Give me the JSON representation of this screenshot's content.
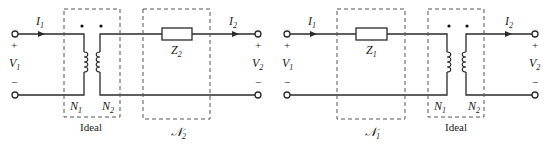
{
  "diagram": {
    "circuits": [
      {
        "id": "left",
        "input_current": {
          "name": "I",
          "sub": "1"
        },
        "input_voltage": {
          "name": "V",
          "sub": "1"
        },
        "output_current": {
          "name": "I",
          "sub": "2"
        },
        "output_voltage": {
          "name": "V",
          "sub": "2"
        },
        "plus": "+",
        "minus": "−",
        "transformer": {
          "box_label": "Ideal",
          "primary": {
            "name": "N",
            "sub": "1"
          },
          "secondary": {
            "name": "N",
            "sub": "2"
          }
        },
        "network": {
          "box_label": {
            "name": "𝒩",
            "sub": "2"
          },
          "impedance": {
            "name": "Z",
            "sub": "2"
          }
        }
      },
      {
        "id": "right",
        "input_current": {
          "name": "I",
          "sub": "1"
        },
        "input_voltage": {
          "name": "V",
          "sub": "1"
        },
        "output_current": {
          "name": "I",
          "sub": "2"
        },
        "output_voltage": {
          "name": "V",
          "sub": "2"
        },
        "plus": "+",
        "minus": "−",
        "network": {
          "box_label": {
            "name": "𝒩",
            "sub": "1"
          },
          "impedance": {
            "name": "Z",
            "sub": "1"
          }
        },
        "transformer": {
          "box_label": "Ideal",
          "primary": {
            "name": "N",
            "sub": "1"
          },
          "secondary": {
            "name": "N",
            "sub": "2"
          }
        }
      }
    ]
  }
}
